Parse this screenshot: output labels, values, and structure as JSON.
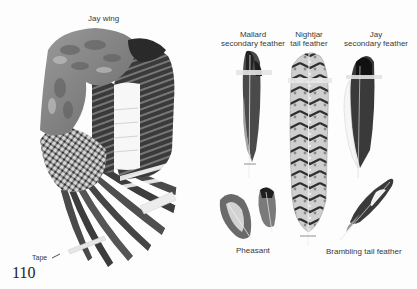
{
  "page": {
    "page_number": "110",
    "colors": {
      "background": "#fdfdfd",
      "ink_dark": "#1e1e1e",
      "ink_mid": "#7a7a7a",
      "ink_light": "#b8b8b8",
      "text": "#3a3a3a"
    }
  },
  "wing": {
    "title": "Jay wing",
    "tape_label": "Tape"
  },
  "feathers": [
    {
      "id": "mallard",
      "label_line1": "Mallard",
      "label_line2": "secondary feather"
    },
    {
      "id": "nightjar",
      "label_line1": "Nightjar",
      "label_line2": "tail feather"
    },
    {
      "id": "jay",
      "label_line1": "Jay",
      "label_line2": "secondary feather"
    },
    {
      "id": "pheasant",
      "label_line1": "Pheasant"
    },
    {
      "id": "brambling",
      "label_line1": "Brambling tail feather"
    }
  ]
}
